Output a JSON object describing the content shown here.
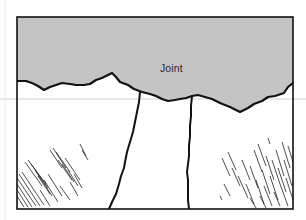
{
  "diagram": {
    "label": "Joint",
    "label_position": {
      "x": 160,
      "y": 62
    },
    "colors": {
      "background": "#ffffff",
      "joint_fill": "#c4c4c4",
      "outline": "#111111",
      "hatch": "#222222",
      "guide_line": "#d0d0d0"
    },
    "frame": {
      "x": 17,
      "y": 17,
      "width": 276,
      "height": 192
    },
    "regions": [
      {
        "name": "joint-space",
        "description": "grey filled upper region between surfaces"
      },
      {
        "name": "left-bone",
        "description": "lower-left white region with hatching"
      },
      {
        "name": "middle-bone",
        "description": "central white region bounded by two cracks"
      },
      {
        "name": "right-bone",
        "description": "lower-right white region with hatching"
      }
    ]
  }
}
